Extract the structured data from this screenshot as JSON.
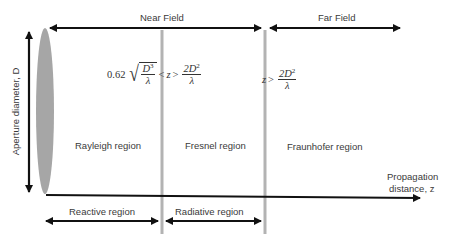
{
  "diagram": {
    "top_labels": {
      "near_field": "Near Field",
      "far_field": "Far Field"
    },
    "axis_labels": {
      "vertical": "Aperture diameter, D",
      "horizontal_line1": "Propagation",
      "horizontal_line2": "distance, z"
    },
    "regions": {
      "rayleigh": "Rayleigh region",
      "fresnel": "Fresnel region",
      "fraunhofer": "Fraunhofer region"
    },
    "bottom_labels": {
      "reactive": "Reactive region",
      "radiative": "Radiative region"
    },
    "formulas": {
      "fresnel": {
        "coef": "0.62",
        "sqrt_num_base": "D",
        "sqrt_num_exp": "3",
        "sqrt_den": "λ",
        "lt": "<",
        "var": "z",
        "gt": ">",
        "frac_num_coef": "2D",
        "frac_num_exp": "2",
        "frac_den": "λ"
      },
      "fraunhofer": {
        "var": "z",
        "gt": ">",
        "frac_num_coef": "2D",
        "frac_num_exp": "2",
        "frac_den": "λ"
      }
    },
    "colors": {
      "arrow": "#111111",
      "boundary": "#b3b3b3",
      "aperture": "#a6a6a6"
    }
  }
}
